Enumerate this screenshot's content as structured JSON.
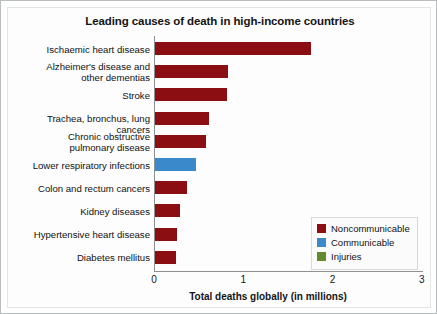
{
  "chart_data": {
    "type": "bar",
    "orientation": "horizontal",
    "title": "Leading causes of death in high-income countries",
    "xlabel": "Total deaths globally (in millions)",
    "ylabel": "",
    "xlim": [
      0,
      3
    ],
    "xticks": [
      "0",
      "1",
      "2",
      "3"
    ],
    "grid": false,
    "legend_position": "center-right",
    "categories": [
      "Ischaemic heart disease",
      "Alzheimer's disease and other dementias",
      "Stroke",
      "Trachea, bronchus, lung cancers",
      "Chronic obstructive pulmonary disease",
      "Lower respiratory infections",
      "Colon and rectum cancers",
      "Kidney diseases",
      "Hypertensive heart disease",
      "Diabetes mellitus"
    ],
    "values": [
      1.75,
      0.82,
      0.81,
      0.61,
      0.57,
      0.46,
      0.36,
      0.28,
      0.25,
      0.23
    ],
    "groups": [
      "Noncommunicable",
      "Noncommunicable",
      "Noncommunicable",
      "Noncommunicable",
      "Noncommunicable",
      "Communicable",
      "Noncommunicable",
      "Noncommunicable",
      "Noncommunicable",
      "Noncommunicable"
    ]
  },
  "category_lines": [
    [
      "Ischaemic heart disease"
    ],
    [
      "Alzheimer's disease and",
      "other dementias"
    ],
    [
      "Stroke"
    ],
    [
      "Trachea, bronchus, lung cancers"
    ],
    [
      "Chronic obstructive",
      "pulmonary disease"
    ],
    [
      "Lower respiratory infections"
    ],
    [
      "Colon and rectum cancers"
    ],
    [
      "Kidney diseases"
    ],
    [
      "Hypertensive heart disease"
    ],
    [
      "Diabetes mellitus"
    ]
  ],
  "legend": {
    "items": [
      {
        "label": "Noncommunicable",
        "color": "#8b0e13"
      },
      {
        "label": "Communicable",
        "color": "#3a8acb"
      },
      {
        "label": "Injuries",
        "color": "#64892f"
      }
    ]
  },
  "colors": {
    "noncommunicable": "#8b0e13",
    "communicable": "#3a8acb",
    "injuries": "#64892f",
    "axis": "#8d9090",
    "text": "#111111",
    "background": "#fdfdfd"
  }
}
